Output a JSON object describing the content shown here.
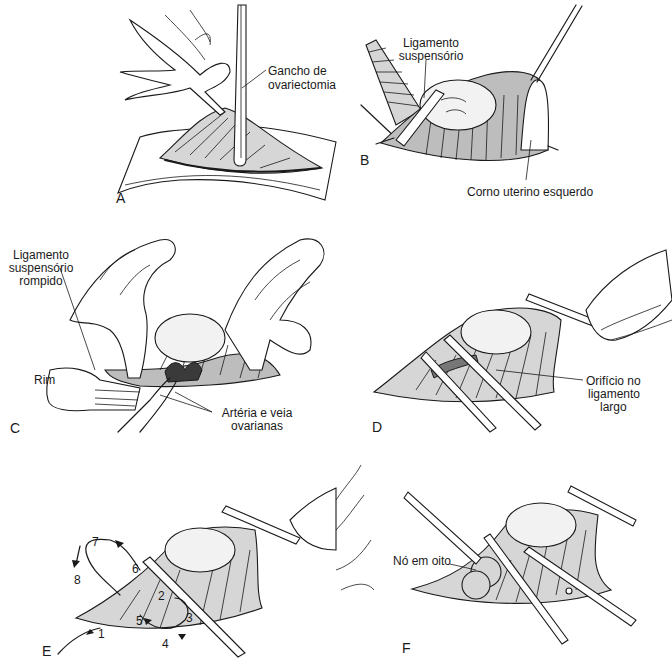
{
  "figure": {
    "panels": [
      {
        "id": "A",
        "label": "A",
        "annotations": [
          "Gancho de ovariectomia"
        ]
      },
      {
        "id": "B",
        "label": "B",
        "annotations": [
          "Ligamento suspensório",
          "Corno uterino esquerdo"
        ]
      },
      {
        "id": "C",
        "label": "C",
        "annotations": [
          "Ligamento suspensório rompido",
          "Rim",
          "Artéria e veia ovarianas"
        ]
      },
      {
        "id": "D",
        "label": "D",
        "annotations": [
          "Orifício no ligamento largo"
        ]
      },
      {
        "id": "E",
        "label": "E",
        "annotations": [],
        "sequence_numbers": [
          "1",
          "2",
          "3",
          "4",
          "5",
          "6",
          "7",
          "8"
        ]
      },
      {
        "id": "F",
        "label": "F",
        "annotations": [
          "Nó em oito"
        ]
      }
    ]
  },
  "panelA": {
    "letter": "A",
    "hook_line1": "Gancho de",
    "hook_line2": "ovariectomia"
  },
  "panelB": {
    "letter": "B",
    "lig_line1": "Ligamento",
    "lig_line2": "suspensório",
    "horn": "Corno uterino esquerdo"
  },
  "panelC": {
    "letter": "C",
    "torn_line1": "Ligamento",
    "torn_line2": "suspensório",
    "torn_line3": "rompido",
    "kidney": "Rim",
    "vessels_line1": "Artéria e veia",
    "vessels_line2": "ovarianas"
  },
  "panelD": {
    "letter": "D",
    "hole_line1": "Orifício no",
    "hole_line2": "ligamento",
    "hole_line3": "largo"
  },
  "panelE": {
    "letter": "E",
    "steps": [
      "1",
      "2",
      "3",
      "4",
      "5",
      "6",
      "7",
      "8"
    ]
  },
  "panelF": {
    "letter": "F",
    "knot": "Nó em oito"
  }
}
